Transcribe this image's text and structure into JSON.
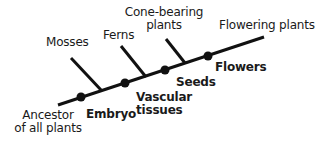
{
  "diagram": {
    "type": "cladogram",
    "line_color": "#111111",
    "background": "#ffffff",
    "root_label": [
      "Ancestor",
      "of all plants"
    ],
    "groups": [
      {
        "label": "Mosses"
      },
      {
        "label": "Ferns"
      },
      {
        "label": [
          "Cone-bearing",
          "plants"
        ]
      },
      {
        "label": "Flowering plants"
      }
    ],
    "traits": [
      {
        "label": "Embryo"
      },
      {
        "label": [
          "Vascular",
          "tissues"
        ]
      },
      {
        "label": "Seeds"
      },
      {
        "label": "Flowers"
      }
    ]
  }
}
